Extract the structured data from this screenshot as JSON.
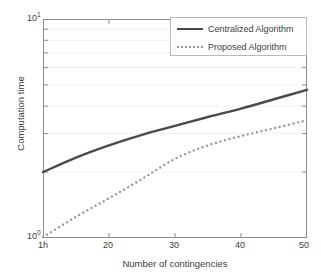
{
  "chart_data": {
    "type": "line",
    "title": "",
    "xlabel": "Number of contingencies",
    "ylabel": "Computation time",
    "xlim": [
      10,
      50
    ],
    "ylim": [
      1,
      10
    ],
    "yscale": "log",
    "xscale": "linear",
    "grid": true,
    "grid_orientation": "horizontal-minor-log",
    "legend_position": "top-right",
    "x_tick_labels": [
      "1h",
      "20",
      "30",
      "40",
      "50"
    ],
    "x_tick_values": [
      10,
      20,
      30,
      40,
      50
    ],
    "y_tick_labels": [
      "10⁰",
      "10¹"
    ],
    "y_tick_values": [
      1,
      10
    ],
    "x": [
      10,
      15,
      20,
      25,
      30,
      35,
      40,
      45,
      50
    ],
    "series": [
      {
        "name": "Centralized Algorithm",
        "style": "solid",
        "color": "#4a4a4a",
        "values": [
          2.0,
          2.33,
          2.65,
          2.96,
          3.25,
          3.57,
          3.9,
          4.3,
          4.75
        ]
      },
      {
        "name": "Proposed Algorithm",
        "style": "dotted",
        "color": "#9a9a9a",
        "values": [
          1.01,
          1.25,
          1.52,
          1.86,
          2.3,
          2.65,
          2.92,
          3.17,
          3.45
        ]
      }
    ]
  },
  "axes": {
    "y_top_label_base": "10",
    "y_top_label_exp": "1",
    "y_bottom_label_base": "10",
    "y_bottom_label_exp": "0",
    "x_ticks": [
      {
        "label": "1h"
      },
      {
        "label": "20"
      },
      {
        "label": "30"
      },
      {
        "label": "40"
      },
      {
        "label": "50"
      }
    ]
  },
  "labels": {
    "x_axis_title": "Number of contingencies",
    "y_axis_title": "Computation time"
  },
  "legend": {
    "entries": [
      {
        "label": "Centralized Algorithm",
        "style": "solid"
      },
      {
        "label": "Proposed Algorithm",
        "style": "dotted"
      }
    ]
  },
  "colors": {
    "series_centralized": "#4a4a4a",
    "series_proposed": "#9a9a9a",
    "axis": "#8a8a8a",
    "grid": "#f0f0f0",
    "text": "#3c3c3c",
    "background": "#ffffff"
  }
}
